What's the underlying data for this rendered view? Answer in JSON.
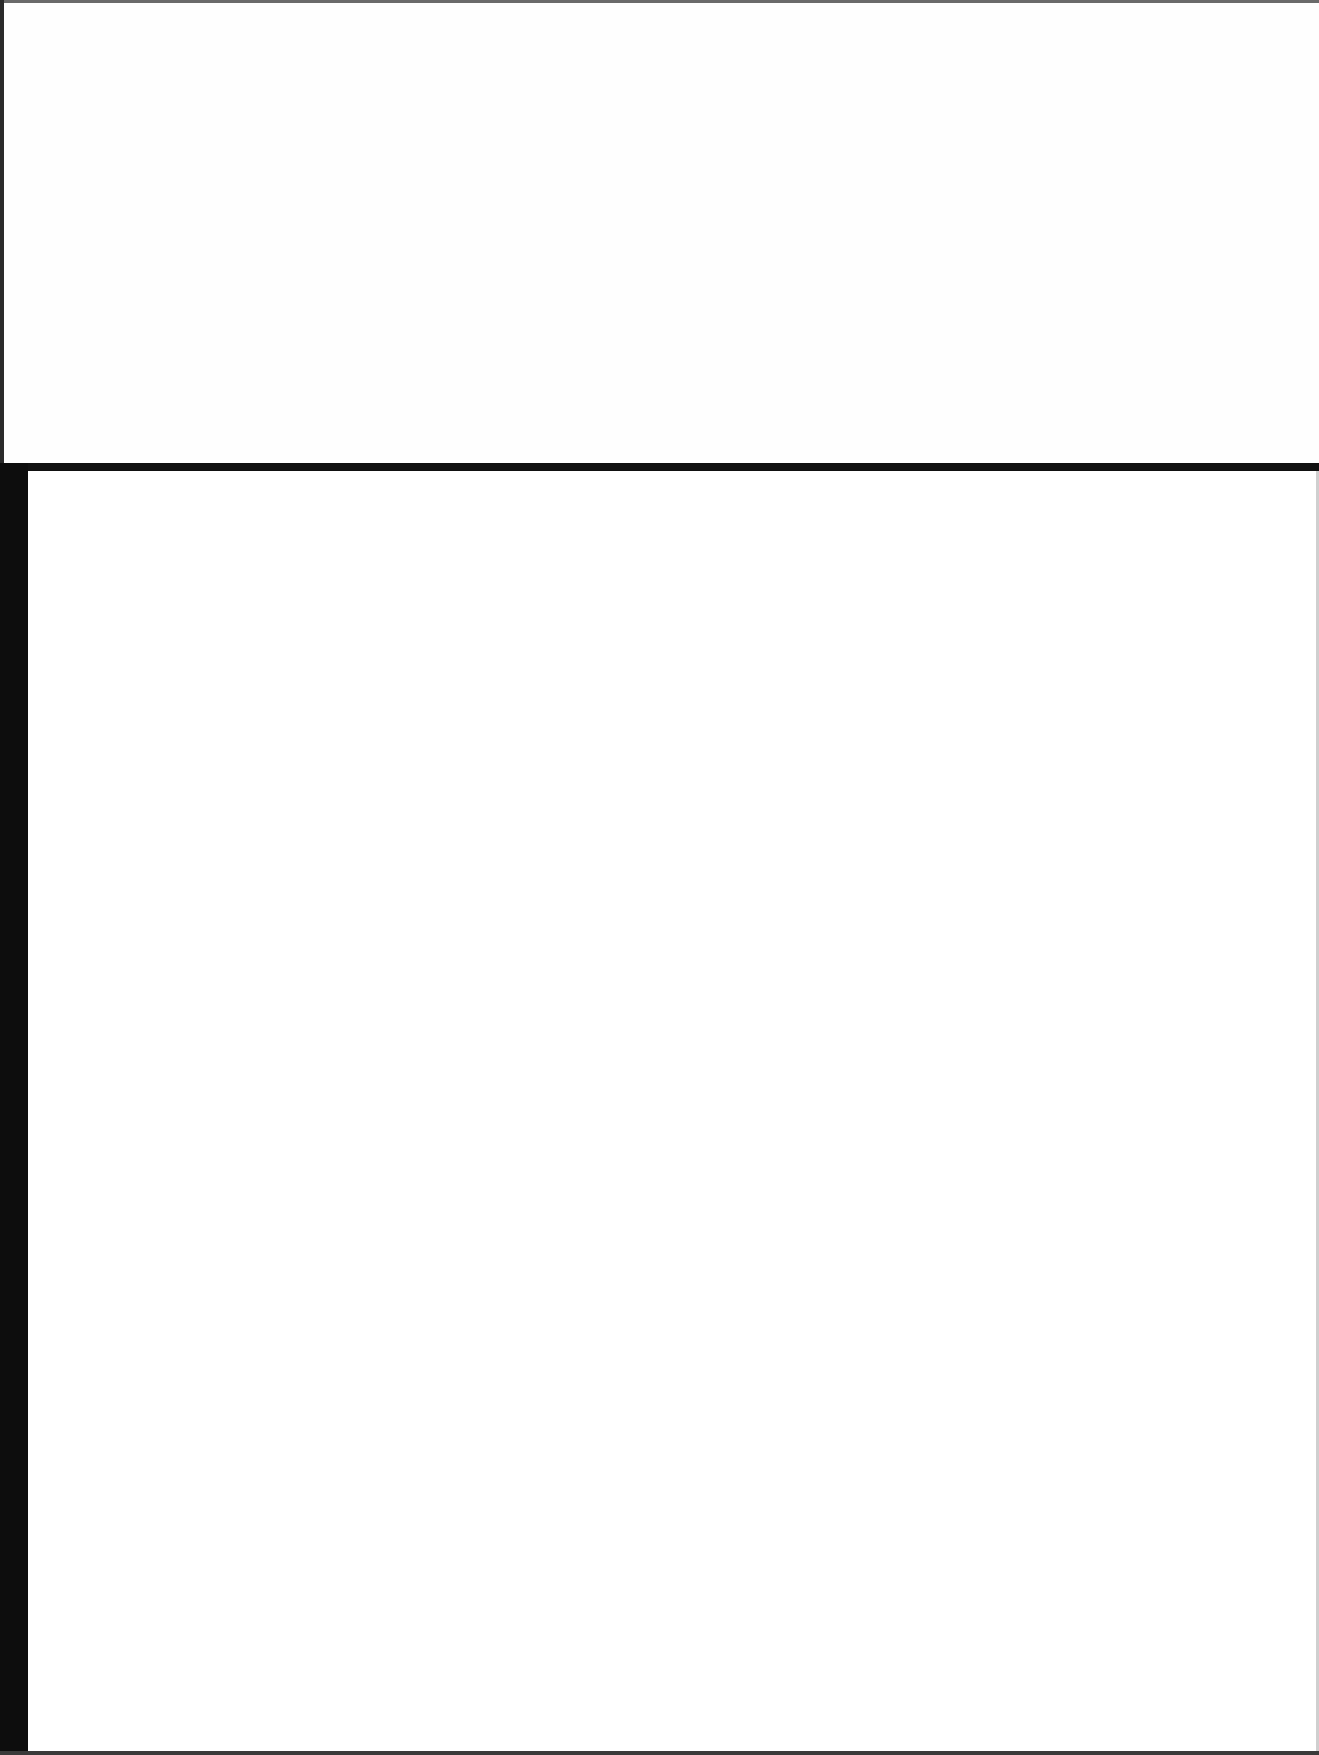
{
  "document": {
    "type": "scanned-page",
    "content_text": "",
    "regions": [
      {
        "name": "upper-region",
        "text": ""
      },
      {
        "name": "lower-region",
        "text": ""
      }
    ],
    "colors": {
      "background": "#fdfdfd",
      "rule": "#111111",
      "bar": "#0d0d0d"
    }
  }
}
